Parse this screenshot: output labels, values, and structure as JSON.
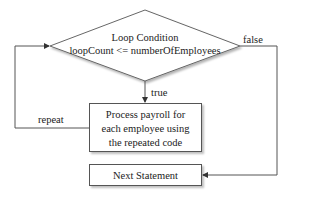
{
  "diagram": {
    "type": "flowchart",
    "nodes": {
      "condition": {
        "shape": "diamond",
        "title": "Loop Condition",
        "expression": "loopCount <= numberOfEmployees"
      },
      "process": {
        "shape": "rectangle",
        "lines": [
          "Process payroll for",
          "each employee using",
          "the repeated code"
        ]
      },
      "next": {
        "shape": "rectangle",
        "label": "Next Statement"
      }
    },
    "edges": {
      "true_label": "true",
      "false_label": "false",
      "repeat_label": "repeat"
    },
    "colors": {
      "stroke": "#555555",
      "text": "#222222",
      "background": "#ffffff"
    }
  }
}
